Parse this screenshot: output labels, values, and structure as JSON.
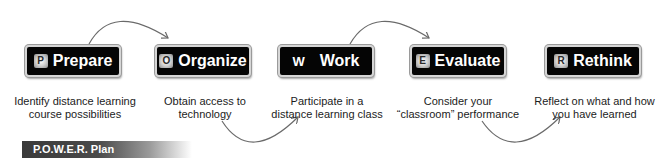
{
  "diagram": {
    "title": "P.O.W.E.R. Plan",
    "steps": [
      {
        "letter": "P",
        "label": "Prepare",
        "caption_line1": "Identify distance learning",
        "caption_line2": "course possibilities"
      },
      {
        "letter": "O",
        "label": "Organize",
        "caption_line1": "Obtain access to",
        "caption_line2": "technology"
      },
      {
        "letter": "W",
        "label": "Work",
        "caption_line1": "Participate in a",
        "caption_line2": "distance learning class"
      },
      {
        "letter": "E",
        "label": "Evaluate",
        "caption_line1": "Consider your",
        "caption_line2": "“classroom” performance"
      },
      {
        "letter": "R",
        "label": "Rethink",
        "caption_line1": "Reflect on what and how",
        "caption_line2": "you have learned"
      }
    ],
    "arrows": [
      {
        "from": "Prepare",
        "to": "Organize",
        "position": "top"
      },
      {
        "from": "Organize",
        "to": "Work",
        "position": "bottom"
      },
      {
        "from": "Work",
        "to": "Evaluate",
        "position": "top"
      },
      {
        "from": "Evaluate",
        "to": "Rethink",
        "position": "bottom"
      }
    ],
    "colors": {
      "box_bg": "#050505",
      "box_border": "#d6d6d6",
      "arrow": "#6a6a6a",
      "caption": "#1c1c1c"
    }
  }
}
